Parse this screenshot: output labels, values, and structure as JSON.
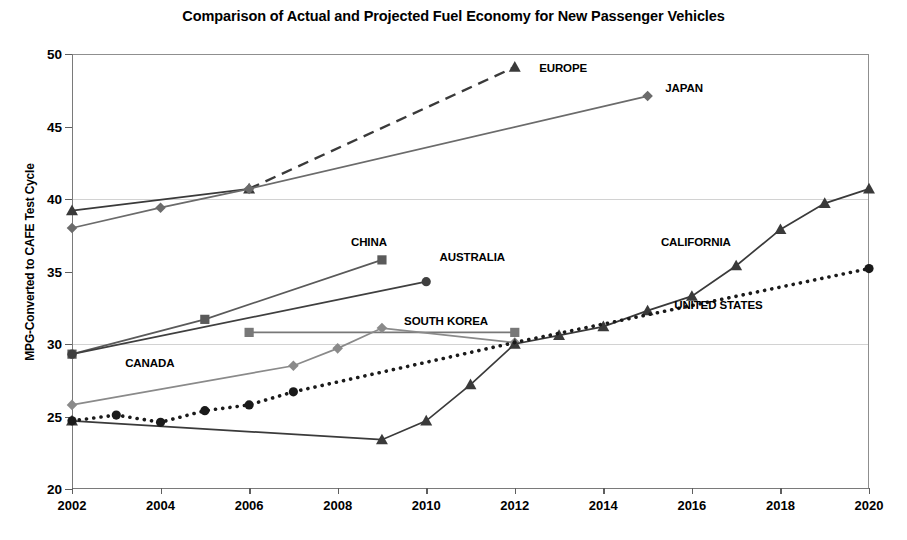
{
  "chart_data": {
    "type": "line",
    "title": "Comparison of Actual and Projected Fuel Economy for New Passenger Vehicles",
    "xlabel": "",
    "ylabel": "MPG-Converted to CAFE Test Cycle",
    "xlim": [
      2002,
      2020
    ],
    "ylim": [
      20,
      50
    ],
    "yticks": [
      20,
      25,
      30,
      35,
      40,
      45,
      50
    ],
    "xticks": [
      2002,
      2004,
      2006,
      2008,
      2010,
      2012,
      2014,
      2016,
      2018,
      2020
    ],
    "grid": "horizontal-light",
    "legend": "inline-labels",
    "series": [
      {
        "name": "EUROPE",
        "marker": "triangle",
        "linestyle": "solid-then-dashed",
        "color": "#3a3a3a",
        "label_x": 2012.55,
        "label_y": 49.0,
        "points": [
          {
            "x": 2002,
            "y": 39.2
          },
          {
            "x": 2006,
            "y": 40.7
          },
          {
            "x": 2012,
            "y": 49.1
          }
        ]
      },
      {
        "name": "JAPAN",
        "marker": "diamond",
        "linestyle": "solid",
        "color": "#6b6b6b",
        "label_x": 2015.4,
        "label_y": 47.6,
        "points": [
          {
            "x": 2002,
            "y": 38.0
          },
          {
            "x": 2004,
            "y": 39.4
          },
          {
            "x": 2006,
            "y": 40.7
          },
          {
            "x": 2015,
            "y": 47.1
          }
        ]
      },
      {
        "name": "CHINA",
        "marker": "square",
        "linestyle": "solid",
        "color": "#5a5a5a",
        "label_x": 2008.3,
        "label_y": 37.0,
        "points": [
          {
            "x": 2002,
            "y": 29.3
          },
          {
            "x": 2005,
            "y": 31.7
          },
          {
            "x": 2009,
            "y": 35.8
          }
        ]
      },
      {
        "name": "AUSTRALIA",
        "marker": "circle",
        "linestyle": "solid",
        "color": "#3f3f3f",
        "label_x": 2010.3,
        "label_y": 35.9,
        "points": [
          {
            "x": 2002,
            "y": 29.3
          },
          {
            "x": 2010,
            "y": 34.3
          }
        ]
      },
      {
        "name": "SOUTH KOREA",
        "marker": "square",
        "linestyle": "solid",
        "color": "#787878",
        "label_x": 2009.5,
        "label_y": 31.5,
        "points": [
          {
            "x": 2006,
            "y": 30.8
          },
          {
            "x": 2012,
            "y": 30.8
          }
        ]
      },
      {
        "name": "CANADA",
        "marker": "diamond",
        "linestyle": "solid",
        "color": "#8a8a8a",
        "label_x": 2003.2,
        "label_y": 28.6,
        "points": [
          {
            "x": 2002,
            "y": 25.8
          },
          {
            "x": 2007,
            "y": 28.5
          },
          {
            "x": 2008,
            "y": 29.7
          },
          {
            "x": 2009,
            "y": 31.1
          },
          {
            "x": 2012,
            "y": 30.1
          }
        ]
      },
      {
        "name": "CALIFORNIA",
        "marker": "triangle",
        "linestyle": "solid",
        "color": "#3a3a3a",
        "label_x": 2015.3,
        "label_y": 37.0,
        "points": [
          {
            "x": 2002,
            "y": 24.7
          },
          {
            "x": 2009,
            "y": 23.4
          },
          {
            "x": 2010,
            "y": 24.7
          },
          {
            "x": 2011,
            "y": 27.2
          },
          {
            "x": 2012,
            "y": 30.0
          },
          {
            "x": 2013,
            "y": 30.6
          },
          {
            "x": 2014,
            "y": 31.2
          },
          {
            "x": 2015,
            "y": 32.3
          },
          {
            "x": 2016,
            "y": 33.3
          },
          {
            "x": 2017,
            "y": 35.4
          },
          {
            "x": 2018,
            "y": 37.9
          },
          {
            "x": 2019,
            "y": 39.7
          },
          {
            "x": 2020,
            "y": 40.7
          }
        ]
      },
      {
        "name": "UNITED STATES",
        "marker": "circle",
        "linestyle": "dotted",
        "color": "#1a1a1a",
        "label_x": 2015.6,
        "label_y": 32.6,
        "points": [
          {
            "x": 2002,
            "y": 24.7
          },
          {
            "x": 2003,
            "y": 25.1
          },
          {
            "x": 2004,
            "y": 24.6
          },
          {
            "x": 2005,
            "y": 25.4
          },
          {
            "x": 2006,
            "y": 25.8
          },
          {
            "x": 2007,
            "y": 26.7
          },
          {
            "x": 2012,
            "y": 30.1
          },
          {
            "x": 2020,
            "y": 35.2
          }
        ]
      }
    ]
  }
}
